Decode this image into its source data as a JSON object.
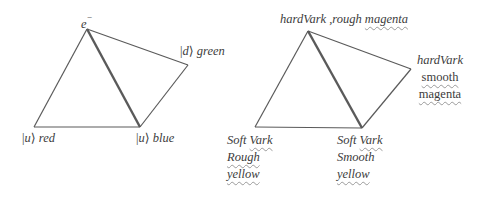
{
  "left_diagram": {
    "apex_label": "e",
    "apex_superscript": "−",
    "vertices": {
      "bottom_left": {
        "ket": "u",
        "color": "red"
      },
      "bottom_right": {
        "ket": "u",
        "color": "blue"
      },
      "right": {
        "ket": "d",
        "color": "green"
      }
    }
  },
  "right_diagram": {
    "apex_label": {
      "part1": "hardVark",
      "part2": " ,rough ",
      "part3": "magenta"
    },
    "right_label": {
      "line1": "hardVark",
      "line2": "smooth",
      "line3": "magenta"
    },
    "bottom_left_label": {
      "line1a": "Soft ",
      "line1b": "Vark",
      "line2": "Rough",
      "line3": "yellow"
    },
    "bottom_right_label": {
      "line1a": "Soft ",
      "line1b": "Vark",
      "line2": "Smooth",
      "line3": "yellow"
    }
  },
  "colors": {
    "line": "#555555",
    "text": "#3c3c3c",
    "squiggle": "#9a9a9a"
  }
}
